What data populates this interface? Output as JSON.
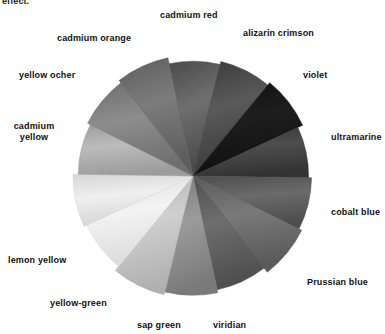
{
  "page": {
    "clipped_text": "effect.",
    "background_color": "#ffffff",
    "text_color": "#111111"
  },
  "wheel": {
    "center_x": 193,
    "center_y": 176,
    "radius": 119,
    "sector_count": 14,
    "start_angle_deg": -102,
    "sectors": [
      {
        "name": "cadmium red",
        "color": "#6f6f6f",
        "edge_color": "#4a4a4a"
      },
      {
        "name": "alizarin crimson",
        "color": "#5a5a5a",
        "edge_color": "#3a3a3a"
      },
      {
        "name": "violet",
        "color": "#1e1e1e",
        "edge_color": "#101010"
      },
      {
        "name": "ultramarine",
        "color": "#4e4e4e",
        "edge_color": "#333333"
      },
      {
        "name": "cobalt blue",
        "color": "#6a6a6a",
        "edge_color": "#4d4d4d"
      },
      {
        "name": "Prussian blue",
        "color": "#7a7a7a",
        "edge_color": "#5a5a5a"
      },
      {
        "name": "viridian",
        "color": "#6e6e6e",
        "edge_color": "#4f4f4f"
      },
      {
        "name": "sap green",
        "color": "#9b9b9b",
        "edge_color": "#7a7a7a"
      },
      {
        "name": "yellow-green",
        "color": "#cfcfcf",
        "edge_color": "#b0b0b0"
      },
      {
        "name": "lemon yellow",
        "color": "#f3f3f3",
        "edge_color": "#dcdcdc"
      },
      {
        "name": "cadmium yellow",
        "color": "#efefef",
        "edge_color": "#d5d5d5"
      },
      {
        "name": "yellow ocher",
        "color": "#bcbcbc",
        "edge_color": "#9c9c9c"
      },
      {
        "name": "cadmium orange",
        "color": "#8d8d8d",
        "edge_color": "#6e6e6e"
      },
      {
        "name": "cadmium red 2",
        "color": "#7c7c7c",
        "edge_color": "#5d5d5d"
      }
    ]
  },
  "labels": [
    {
      "id": "cadmium-red",
      "text": "cadmium red",
      "x": 160,
      "y": 10,
      "lines": 1
    },
    {
      "id": "alizarin-crimson",
      "text": "alizarin crimson",
      "x": 243,
      "y": 28,
      "lines": 1
    },
    {
      "id": "cadmium-orange",
      "text": "cadmium orange",
      "x": 57,
      "y": 33,
      "lines": 1
    },
    {
      "id": "violet",
      "text": "violet",
      "x": 303,
      "y": 70,
      "lines": 1
    },
    {
      "id": "yellow-ocher",
      "text": "yellow ocher",
      "x": 19,
      "y": 70,
      "lines": 1
    },
    {
      "id": "ultramarine",
      "text": "ultramarine",
      "x": 331,
      "y": 132,
      "lines": 1
    },
    {
      "id": "cadmium-yellow",
      "text": "cadmium yellow",
      "x": 4,
      "y": 121,
      "lines": 2
    },
    {
      "id": "cobalt-blue",
      "text": "cobalt blue",
      "x": 331,
      "y": 207,
      "lines": 1
    },
    {
      "id": "lemon-yellow",
      "text": "lemon yellow",
      "x": 8,
      "y": 255,
      "lines": 1
    },
    {
      "id": "prussian-blue",
      "text": "Prussian blue",
      "x": 307,
      "y": 277,
      "lines": 1
    },
    {
      "id": "yellow-green",
      "text": "yellow-green",
      "x": 50,
      "y": 298,
      "lines": 1
    },
    {
      "id": "sap-green",
      "text": "sap green",
      "x": 137,
      "y": 320,
      "lines": 1
    },
    {
      "id": "viridian",
      "text": "viridian",
      "x": 213,
      "y": 320,
      "lines": 1
    }
  ]
}
